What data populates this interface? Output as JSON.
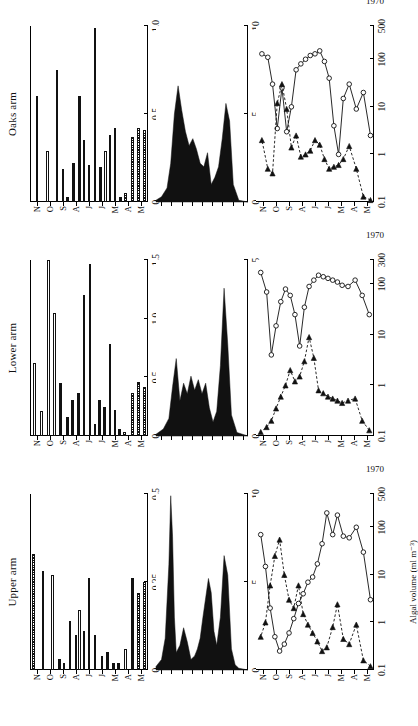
{
  "figure": {
    "year_label": "1970",
    "months": [
      "M",
      "A",
      "M",
      "J",
      "J",
      "A",
      "S",
      "O",
      "N"
    ],
    "axis_titles": {
      "nitrogen": "Nitrogen (mg l⁻¹)",
      "fixation_line1": "Nitrogen fixation",
      "fixation_line2": "(as ethylene)",
      "fixation_line3": "(m moles m⁻² day⁻¹)",
      "algal": "Algal volume (ml m⁻³)"
    },
    "panels": [
      {
        "key": "upper",
        "title": "Upper arm"
      },
      {
        "key": "lower",
        "title": "Lower arm"
      },
      {
        "key": "oaks",
        "title": "Oaks arm"
      }
    ]
  },
  "chart_data": [
    {
      "type": "bar",
      "panel": "Upper arm",
      "title": "Nitrogen (mg l⁻¹) — Upper arm",
      "xlabel": "1970",
      "ylabel": "Nitrogen (mg l⁻¹)",
      "orientation": "horizontal",
      "ylim": [
        0,
        0.5
      ],
      "yticks": [
        0,
        0.25,
        0.5
      ],
      "ytick_labels": [
        "0",
        "0.25",
        "0.5"
      ],
      "categories": [
        "M",
        "A",
        "M",
        "J",
        "J",
        "A",
        "S",
        "O",
        "N"
      ],
      "bars": [
        {
          "t": 0.02,
          "v": 0.25,
          "fill": "hatch"
        },
        {
          "t": 0.07,
          "v": 0.22,
          "fill": "hatch"
        },
        {
          "t": 0.12,
          "v": 0.26,
          "fill": "solid"
        },
        {
          "t": 0.18,
          "v": 0.06,
          "fill": "open"
        },
        {
          "t": 0.24,
          "v": 0.02,
          "fill": "solid"
        },
        {
          "t": 0.28,
          "v": 0.02,
          "fill": "solid"
        },
        {
          "t": 0.33,
          "v": 0.05,
          "fill": "solid"
        },
        {
          "t": 0.38,
          "v": 0.04,
          "fill": "solid"
        },
        {
          "t": 0.44,
          "v": 0.1,
          "fill": "solid"
        },
        {
          "t": 0.49,
          "v": 0.26,
          "fill": "solid"
        },
        {
          "t": 0.53,
          "v": 0.11,
          "fill": "solid"
        },
        {
          "t": 0.57,
          "v": 0.17,
          "fill": "open"
        },
        {
          "t": 0.6,
          "v": 0.1,
          "fill": "solid"
        },
        {
          "t": 0.65,
          "v": 0.14,
          "fill": "solid"
        },
        {
          "t": 0.7,
          "v": 0.02,
          "fill": "solid"
        },
        {
          "t": 0.74,
          "v": 0.03,
          "fill": "solid"
        },
        {
          "t": 0.8,
          "v": 0.27,
          "fill": "open"
        },
        {
          "t": 0.88,
          "v": 0.28,
          "fill": "hatch"
        },
        {
          "t": 0.96,
          "v": 0.33,
          "fill": "hatch"
        }
      ]
    },
    {
      "type": "area",
      "panel": "Upper arm",
      "title": "Nitrogen fixation — Upper arm",
      "ylabel": "Nitrogen fixation (as ethylene) (m moles m⁻² day⁻¹)",
      "ylim": [
        0,
        10
      ],
      "yticks": [
        0,
        5,
        10
      ],
      "ytick_labels": [
        "0",
        "5",
        "10"
      ],
      "x": [
        0.0,
        0.1,
        0.14,
        0.18,
        0.22,
        0.26,
        0.3,
        0.34,
        0.37,
        0.4,
        0.43,
        0.46,
        0.49,
        0.52,
        0.55,
        0.58,
        0.62,
        0.66,
        0.7,
        0.74,
        0.78,
        0.8,
        0.82,
        0.84,
        0.86,
        0.9,
        0.94,
        1.0
      ],
      "values": [
        0,
        0.1,
        0.3,
        1.2,
        5.4,
        6.5,
        3.0,
        1.4,
        2.2,
        4.4,
        5.2,
        4.1,
        3.0,
        1.8,
        1.2,
        0.8,
        0.6,
        1.6,
        2.4,
        1.4,
        1.0,
        3.0,
        7.6,
        9.9,
        6.0,
        1.8,
        0.6,
        0.2
      ]
    },
    {
      "type": "line",
      "panel": "Upper arm",
      "title": "Algal volume (ml m⁻³) — Upper arm",
      "ylabel": "Algal volume (ml m⁻³)",
      "xlabel": "1970",
      "yscale": "log",
      "ylim": [
        0.1,
        500
      ],
      "yticks": [
        0.1,
        1,
        10,
        100,
        500
      ],
      "ytick_labels": [
        "0.1",
        "1",
        "10",
        "100",
        "500"
      ],
      "categories": [
        "M",
        "A",
        "M",
        "J",
        "J",
        "A",
        "S",
        "O",
        "N"
      ],
      "series": [
        {
          "name": "open-circle-solid-line",
          "marker": "open-circle",
          "line": "solid",
          "x": [
            0.03,
            0.09,
            0.15,
            0.21,
            0.26,
            0.31,
            0.35,
            0.4,
            0.44,
            0.48,
            0.52,
            0.56,
            0.6,
            0.64,
            0.68,
            0.72,
            0.76,
            0.8,
            0.84,
            0.88,
            0.92,
            0.96
          ],
          "values": [
            3.0,
            30,
            100,
            60,
            65,
            180,
            70,
            200,
            45,
            17,
            9,
            7,
            4,
            2.5,
            1.2,
            0.6,
            0.35,
            0.25,
            0.5,
            2.0,
            15,
            70
          ]
        },
        {
          "name": "filled-triangle-dashed-line",
          "marker": "filled-triangle",
          "line": "dashed",
          "x": [
            0.03,
            0.09,
            0.15,
            0.21,
            0.26,
            0.31,
            0.35,
            0.4,
            0.44,
            0.48,
            0.52,
            0.56,
            0.6,
            0.64,
            0.68,
            0.72,
            0.76,
            0.8,
            0.84,
            0.88,
            0.92,
            0.96
          ],
          "values": [
            0.12,
            0.16,
            0.9,
            0.35,
            0.45,
            2.4,
            0.8,
            0.3,
            0.25,
            0.4,
            0.6,
            0.9,
            1.5,
            6.0,
            2.0,
            3.0,
            10,
            55,
            25,
            6,
            1.0,
            0.5
          ]
        }
      ]
    },
    {
      "type": "bar",
      "panel": "Lower arm",
      "title": "Nitrogen (mg l⁻¹) — Lower arm",
      "ylabel": "Nitrogen (mg l⁻¹)",
      "orientation": "horizontal",
      "ylim": [
        0,
        1.5
      ],
      "yticks": [
        0,
        0.5,
        1.0,
        1.5
      ],
      "ytick_labels": [
        "0",
        "0.5",
        "1.0",
        "1.5"
      ],
      "categories": [
        "M",
        "A",
        "M",
        "J",
        "J",
        "A",
        "S",
        "O",
        "N"
      ],
      "bars": [
        {
          "t": 0.02,
          "v": 0.42,
          "fill": "hatch"
        },
        {
          "t": 0.07,
          "v": 0.46,
          "fill": "hatch"
        },
        {
          "t": 0.12,
          "v": 0.37,
          "fill": "hatch"
        },
        {
          "t": 0.19,
          "v": 0.03,
          "fill": "hatch"
        },
        {
          "t": 0.23,
          "v": 0.06,
          "fill": "solid"
        },
        {
          "t": 0.27,
          "v": 0.22,
          "fill": "solid"
        },
        {
          "t": 0.31,
          "v": 0.78,
          "fill": "solid"
        },
        {
          "t": 0.36,
          "v": 0.25,
          "fill": "solid"
        },
        {
          "t": 0.4,
          "v": 0.31,
          "fill": "solid"
        },
        {
          "t": 0.44,
          "v": 0.1,
          "fill": "solid"
        },
        {
          "t": 0.48,
          "v": 1.47,
          "fill": "solid"
        },
        {
          "t": 0.53,
          "v": 1.2,
          "fill": "solid"
        },
        {
          "t": 0.58,
          "v": 0.37,
          "fill": "solid"
        },
        {
          "t": 0.63,
          "v": 0.31,
          "fill": "solid"
        },
        {
          "t": 0.67,
          "v": 0.16,
          "fill": "solid"
        },
        {
          "t": 0.73,
          "v": 0.45,
          "fill": "solid"
        },
        {
          "t": 0.78,
          "v": 1.05,
          "fill": "open"
        },
        {
          "t": 0.83,
          "v": 1.5,
          "fill": "open"
        },
        {
          "t": 0.89,
          "v": 0.21,
          "fill": "open"
        },
        {
          "t": 0.95,
          "v": 0.62,
          "fill": "open"
        }
      ]
    },
    {
      "type": "area",
      "panel": "Lower arm",
      "title": "Nitrogen fixation — Lower arm",
      "ylabel": "Nitrogen fixation (as ethylene) (m moles m⁻² day⁻¹)",
      "ylim": [
        0,
        5
      ],
      "yticks": [
        0,
        5
      ],
      "ytick_labels": [
        "0",
        "5"
      ],
      "x": [
        0.0,
        0.12,
        0.18,
        0.22,
        0.26,
        0.3,
        0.34,
        0.38,
        0.42,
        0.46,
        0.5,
        0.54,
        0.58,
        0.62,
        0.66,
        0.7,
        0.74,
        0.78,
        0.82,
        0.86,
        0.92,
        1.0
      ],
      "values": [
        0,
        0.1,
        0.6,
        2.6,
        4.2,
        2.0,
        0.7,
        0.4,
        0.8,
        1.5,
        1.2,
        1.6,
        1.3,
        1.7,
        1.2,
        1.5,
        1.0,
        2.2,
        1.4,
        0.5,
        0.2,
        0.05
      ]
    },
    {
      "type": "line",
      "panel": "Lower arm",
      "title": "Algal volume (ml m⁻³) — Lower arm",
      "ylabel": "Algal volume (ml m⁻³)",
      "xlabel": "1970",
      "yscale": "log",
      "ylim": [
        0.1,
        300
      ],
      "yticks": [
        0.1,
        1,
        10,
        100,
        300
      ],
      "ytick_labels": [
        "0.1",
        "1",
        "10",
        "100",
        "300"
      ],
      "categories": [
        "M",
        "A",
        "M",
        "J",
        "J",
        "A",
        "S",
        "O",
        "N"
      ],
      "series": [
        {
          "name": "open-circle-solid-line",
          "marker": "open-circle",
          "line": "solid",
          "x": [
            0.04,
            0.1,
            0.16,
            0.22,
            0.27,
            0.31,
            0.35,
            0.39,
            0.43,
            0.47,
            0.51,
            0.55,
            0.59,
            0.63,
            0.67,
            0.71,
            0.75,
            0.79,
            0.83,
            0.87,
            0.91,
            0.96
          ],
          "values": [
            25,
            60,
            120,
            90,
            95,
            110,
            120,
            130,
            140,
            150,
            120,
            90,
            35,
            6,
            25,
            60,
            80,
            45,
            15,
            4,
            70,
            170
          ]
        },
        {
          "name": "filled-triangle-dashed-line",
          "marker": "filled-triangle",
          "line": "dashed",
          "x": [
            0.04,
            0.1,
            0.16,
            0.22,
            0.27,
            0.31,
            0.35,
            0.39,
            0.43,
            0.47,
            0.51,
            0.55,
            0.59,
            0.63,
            0.67,
            0.71,
            0.75,
            0.79,
            0.83,
            0.87,
            0.91,
            0.96
          ],
          "values": [
            0.13,
            0.2,
            0.55,
            0.5,
            0.45,
            0.5,
            0.55,
            0.6,
            0.7,
            0.8,
            3.5,
            9,
            3.0,
            1.5,
            1.2,
            2.0,
            1.0,
            0.6,
            0.35,
            0.2,
            0.15,
            0.12
          ]
        }
      ]
    },
    {
      "type": "bar",
      "panel": "Oaks arm",
      "title": "Nitrogen (mg l⁻¹) — Oaks arm",
      "ylabel": "Nitrogen (mg l⁻¹)",
      "orientation": "horizontal",
      "ylim": [
        0,
        1.0
      ],
      "yticks": [
        0,
        0.5,
        1.0
      ],
      "ytick_labels": [
        "0",
        "0.5",
        "1.0"
      ],
      "categories": [
        "M",
        "A",
        "M",
        "J",
        "J",
        "A",
        "S",
        "O",
        "N"
      ],
      "bars": [
        {
          "t": 0.02,
          "v": 0.41,
          "fill": "hatch"
        },
        {
          "t": 0.07,
          "v": 0.42,
          "fill": "hatch"
        },
        {
          "t": 0.12,
          "v": 0.37,
          "fill": "hatch"
        },
        {
          "t": 0.18,
          "v": 0.05,
          "fill": "hatch"
        },
        {
          "t": 0.22,
          "v": 0.03,
          "fill": "solid"
        },
        {
          "t": 0.27,
          "v": 0.42,
          "fill": "solid"
        },
        {
          "t": 0.31,
          "v": 0.38,
          "fill": "open"
        },
        {
          "t": 0.35,
          "v": 0.29,
          "fill": "open"
        },
        {
          "t": 0.39,
          "v": 0.2,
          "fill": "solid"
        },
        {
          "t": 0.44,
          "v": 0.99,
          "fill": "solid"
        },
        {
          "t": 0.49,
          "v": 0.21,
          "fill": "solid"
        },
        {
          "t": 0.53,
          "v": 0.35,
          "fill": "solid"
        },
        {
          "t": 0.57,
          "v": 0.6,
          "fill": "solid"
        },
        {
          "t": 0.62,
          "v": 0.22,
          "fill": "solid"
        },
        {
          "t": 0.67,
          "v": 0.03,
          "fill": "solid"
        },
        {
          "t": 0.71,
          "v": 0.19,
          "fill": "open"
        },
        {
          "t": 0.76,
          "v": 0.75,
          "fill": "open"
        },
        {
          "t": 0.84,
          "v": 0.29,
          "fill": "open"
        },
        {
          "t": 0.93,
          "v": 0.6,
          "fill": "open"
        }
      ]
    },
    {
      "type": "area",
      "panel": "Oaks arm",
      "title": "Nitrogen fixation — Oaks arm",
      "ylabel": "Nitrogen fixation (as ethylene) (m moles m⁻² day⁻¹)",
      "ylim": [
        0,
        10
      ],
      "yticks": [
        0,
        5,
        10
      ],
      "ytick_labels": [
        "0",
        "5",
        "10"
      ],
      "x": [
        0.0,
        0.1,
        0.16,
        0.2,
        0.24,
        0.28,
        0.32,
        0.36,
        0.4,
        0.44,
        0.48,
        0.52,
        0.56,
        0.6,
        0.64,
        0.68,
        0.72,
        0.76,
        0.8,
        0.84,
        0.88,
        0.94,
        1.0
      ],
      "values": [
        0,
        0.1,
        1.0,
        4.6,
        5.6,
        3.6,
        2.0,
        1.4,
        1.0,
        2.8,
        2.0,
        2.2,
        3.0,
        3.6,
        3.2,
        4.0,
        5.2,
        6.6,
        5.0,
        2.2,
        0.8,
        0.3,
        0.1
      ]
    },
    {
      "type": "line",
      "panel": "Oaks arm",
      "title": "Algal volume (ml m⁻³) — Oaks arm",
      "ylabel": "Algal volume (ml m⁻³)",
      "xlabel": "1970",
      "yscale": "log",
      "ylim": [
        0.1,
        500
      ],
      "yticks": [
        0.1,
        1,
        10,
        100,
        500
      ],
      "ytick_labels": [
        "0.1",
        "1",
        "10",
        "100",
        "500"
      ],
      "categories": [
        "M",
        "A",
        "M",
        "J",
        "J",
        "A",
        "S",
        "O",
        "N"
      ],
      "series": [
        {
          "name": "open-circle-solid-line",
          "marker": "open-circle",
          "line": "solid",
          "x": [
            0.03,
            0.09,
            0.15,
            0.21,
            0.26,
            0.3,
            0.34,
            0.38,
            0.42,
            0.46,
            0.5,
            0.54,
            0.58,
            0.62,
            0.66,
            0.7,
            0.74,
            0.78,
            0.82,
            0.86,
            0.9,
            0.95
          ],
          "values": [
            2.5,
            20,
            9,
            30,
            15,
            1.0,
            4.0,
            40,
            90,
            150,
            130,
            120,
            100,
            80,
            60,
            10,
            3.0,
            25,
            3.5,
            30,
            110,
            130
          ]
        },
        {
          "name": "filled-triangle-dashed-line",
          "marker": "filled-triangle",
          "line": "dashed",
          "x": [
            0.03,
            0.09,
            0.15,
            0.21,
            0.26,
            0.3,
            0.34,
            0.38,
            0.42,
            0.46,
            0.5,
            0.54,
            0.58,
            0.62,
            0.66,
            0.7,
            0.74,
            0.78,
            0.82,
            0.86,
            0.9,
            0.95
          ],
          "values": [
            0.11,
            0.13,
            0.5,
            1.5,
            0.8,
            0.6,
            0.55,
            0.5,
            0.8,
            1.6,
            2.0,
            1.2,
            1.0,
            0.9,
            2.5,
            1.4,
            9,
            30,
            12,
            0.4,
            0.5,
            2.0
          ]
        }
      ]
    }
  ]
}
